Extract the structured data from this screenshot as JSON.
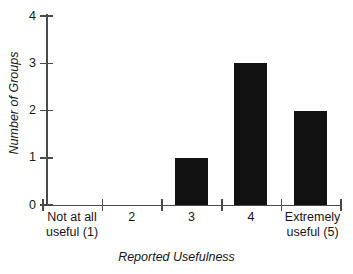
{
  "chart_data": {
    "type": "bar",
    "title": "",
    "xlabel": "Reported Usefulness",
    "ylabel": "Number of Groups",
    "categories": [
      "Not at all\nuseful (1)",
      "2",
      "3",
      "4",
      "Extremely\nuseful (5)"
    ],
    "values": [
      0,
      0,
      1,
      3,
      2
    ],
    "ylim": [
      0,
      4
    ],
    "yticks": [
      0,
      1,
      2,
      3,
      4
    ],
    "ytick_labels": [
      "0",
      "1",
      "2",
      "3",
      "4"
    ],
    "grid": false,
    "legend": null,
    "bar_color": "#121212",
    "axis_color": "#4a4a4a",
    "background_color": "#ffffff"
  },
  "axes": {
    "y_title": "Number of Groups",
    "x_title": "Reported Usefulness"
  },
  "y_ticks": [
    {
      "label": "4",
      "value": 4
    },
    {
      "label": "3",
      "value": 3
    },
    {
      "label": "2",
      "value": 2
    },
    {
      "label": "1",
      "value": 1
    },
    {
      "label": "0",
      "value": 0
    }
  ],
  "x_categories": [
    {
      "label": "Not at all\nuseful (1)",
      "value": 0
    },
    {
      "label": "2",
      "value": 0
    },
    {
      "label": "3",
      "value": 1
    },
    {
      "label": "4",
      "value": 3
    },
    {
      "label": "Extremely\nuseful (5)",
      "value": 2
    }
  ]
}
